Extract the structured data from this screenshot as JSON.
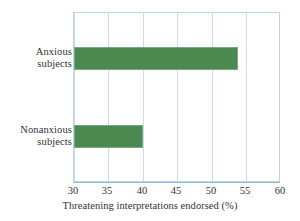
{
  "chart_data": {
    "type": "bar",
    "orientation": "horizontal",
    "title": "",
    "subtitle": "",
    "categories": [
      "Anxious subjects",
      "Nonanxious subjects"
    ],
    "category_lines": [
      [
        "Anxious",
        "subjects"
      ],
      [
        "Nonanxious",
        "subjects"
      ]
    ],
    "values": [
      53.7,
      40.0
    ],
    "xlabel": "Threatening interpretations endorsed (%)",
    "ylabel": "",
    "xlim": [
      30,
      60
    ],
    "xticks": [
      30,
      35,
      40,
      45,
      50,
      55,
      60
    ],
    "xtick_labels": [
      "30",
      "35",
      "40",
      "45",
      "50",
      "55",
      "60"
    ],
    "grid": "vertical",
    "legend": "none",
    "bar_color": "#4a8a51",
    "grid_color": "#c8dcea",
    "axis_color": "#8fb9d6",
    "background": "#ffffff",
    "series": [
      {
        "name": "Threatening interpretations endorsed",
        "points": [
          {
            "category": "Anxious subjects",
            "value": 53.7
          },
          {
            "category": "Nonanxious subjects",
            "value": 40.0
          }
        ]
      }
    ]
  }
}
